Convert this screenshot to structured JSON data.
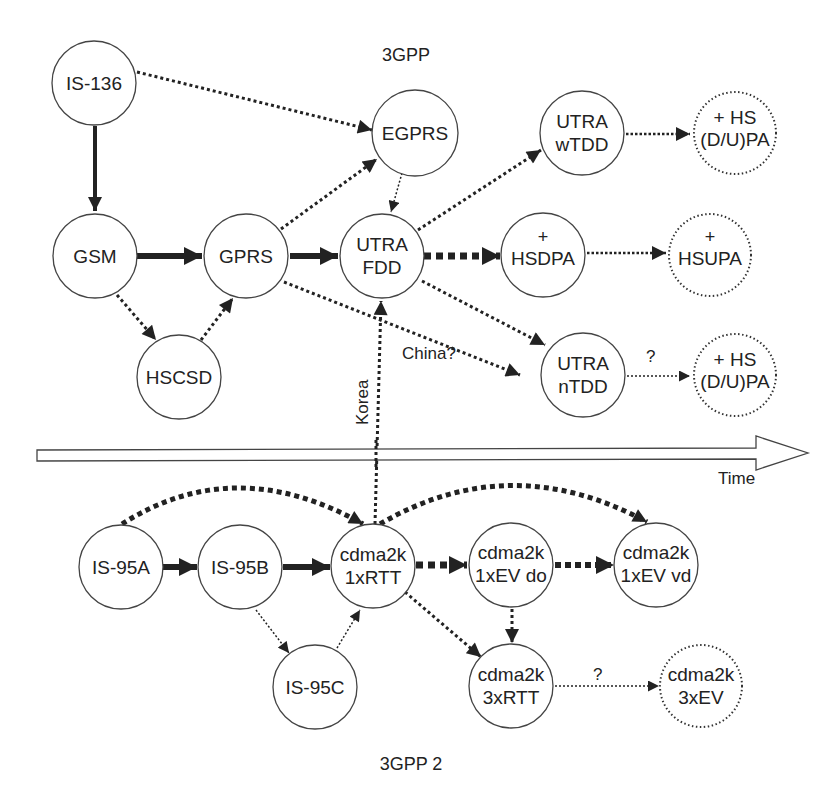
{
  "groups": {
    "top": "3GPP",
    "bottom": "3GPP 2"
  },
  "timeline": {
    "label": "Time"
  },
  "nodes": {
    "is136": {
      "lines": [
        "IS-136"
      ],
      "style": "solid"
    },
    "egprs": {
      "lines": [
        "EGPRS"
      ],
      "style": "solid"
    },
    "utra_wtdd": {
      "lines": [
        "UTRA",
        "wTDD"
      ],
      "style": "solid"
    },
    "hs_dupa_top": {
      "lines": [
        "+ HS",
        "(D/U)PA"
      ],
      "style": "dotted"
    },
    "gsm": {
      "lines": [
        "GSM"
      ],
      "style": "solid"
    },
    "gprs": {
      "lines": [
        "GPRS"
      ],
      "style": "solid"
    },
    "utra_fdd": {
      "lines": [
        "UTRA",
        "FDD"
      ],
      "style": "solid"
    },
    "hsdpa": {
      "plus": "+",
      "lines": [
        "HSDPA"
      ],
      "style": "solid"
    },
    "hsupa": {
      "plus": "+",
      "lines": [
        "HSUPA"
      ],
      "style": "dotted"
    },
    "hscsd": {
      "lines": [
        "HSCSD"
      ],
      "style": "solid"
    },
    "utra_ntdd": {
      "lines": [
        "UTRA",
        "nTDD"
      ],
      "style": "solid"
    },
    "hs_dupa_bottom": {
      "lines": [
        "+ HS",
        "(D/U)PA"
      ],
      "style": "dotted"
    },
    "is95a": {
      "lines": [
        "IS-95A"
      ],
      "style": "solid"
    },
    "is95b": {
      "lines": [
        "IS-95B"
      ],
      "style": "solid"
    },
    "cdma_1xrtt": {
      "lines": [
        "cdma2k",
        "1xRTT"
      ],
      "style": "solid"
    },
    "cdma_1xev_do": {
      "lines": [
        "cdma2k",
        "1xEV do"
      ],
      "style": "solid"
    },
    "cdma_1xev_vd": {
      "lines": [
        "cdma2k",
        "1xEV vd"
      ],
      "style": "solid"
    },
    "is95c": {
      "lines": [
        "IS-95C"
      ],
      "style": "solid"
    },
    "cdma_3xrtt": {
      "lines": [
        "cdma2k",
        "3xRTT"
      ],
      "style": "solid"
    },
    "cdma_3xev": {
      "lines": [
        "cdma2k",
        "3xEV"
      ],
      "style": "dotted"
    }
  },
  "edge_labels": {
    "korea": "Korea",
    "china": "China?",
    "q_ntdd": "?",
    "q_3xrtt": "?"
  },
  "edges": [
    {
      "from": "IS-136",
      "to": "GSM",
      "style": "thick-solid"
    },
    {
      "from": "IS-136",
      "to": "EGPRS",
      "style": "dotted"
    },
    {
      "from": "GSM",
      "to": "GPRS",
      "style": "thick-solid"
    },
    {
      "from": "GSM",
      "to": "HSCSD",
      "style": "dotted"
    },
    {
      "from": "HSCSD",
      "to": "GPRS",
      "style": "dotted"
    },
    {
      "from": "GPRS",
      "to": "EGPRS",
      "style": "dotted"
    },
    {
      "from": "GPRS",
      "to": "UTRA FDD",
      "style": "thick-solid"
    },
    {
      "from": "GPRS",
      "to": "UTRA nTDD",
      "style": "dotted",
      "label": "China?"
    },
    {
      "from": "EGPRS",
      "to": "UTRA FDD",
      "style": "fine-dotted"
    },
    {
      "from": "UTRA FDD",
      "to": "UTRA wTDD",
      "style": "dotted"
    },
    {
      "from": "UTRA FDD",
      "to": "HSDPA",
      "style": "thick-dashed"
    },
    {
      "from": "UTRA FDD",
      "to": "UTRA nTDD",
      "style": "dotted"
    },
    {
      "from": "UTRA wTDD",
      "to": "+HS (D/U)PA",
      "style": "dotted"
    },
    {
      "from": "HSDPA",
      "to": "HSUPA",
      "style": "dotted"
    },
    {
      "from": "UTRA nTDD",
      "to": "+HS (D/U)PA",
      "style": "fine-dotted",
      "label": "?"
    },
    {
      "from": "cdma2k 1xRTT",
      "to": "UTRA FDD",
      "style": "dotted",
      "label": "Korea"
    },
    {
      "from": "IS-95A",
      "to": "IS-95B",
      "style": "thick-solid"
    },
    {
      "from": "IS-95A",
      "to": "cdma2k 1xRTT",
      "style": "dashed-curve"
    },
    {
      "from": "IS-95B",
      "to": "cdma2k 1xRTT",
      "style": "thick-solid"
    },
    {
      "from": "IS-95B",
      "to": "IS-95C",
      "style": "fine-dotted"
    },
    {
      "from": "IS-95C",
      "to": "cdma2k 1xRTT",
      "style": "fine-dotted"
    },
    {
      "from": "cdma2k 1xRTT",
      "to": "cdma2k 1xEV do",
      "style": "thick-dashed"
    },
    {
      "from": "cdma2k 1xRTT",
      "to": "cdma2k 1xEV vd",
      "style": "dashed-curve"
    },
    {
      "from": "cdma2k 1xRTT",
      "to": "cdma2k 3xRTT",
      "style": "dotted"
    },
    {
      "from": "cdma2k 1xEV do",
      "to": "cdma2k 1xEV vd",
      "style": "dashed"
    },
    {
      "from": "cdma2k 1xEV do",
      "to": "cdma2k 3xRTT",
      "style": "dotted"
    },
    {
      "from": "cdma2k 3xRTT",
      "to": "cdma2k 3xEV",
      "style": "fine-dotted",
      "label": "?"
    }
  ],
  "colors": {
    "ink": "#222222",
    "background": "#ffffff"
  }
}
